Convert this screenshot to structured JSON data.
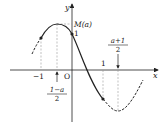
{
  "diagram": {
    "type": "function-graph",
    "axes": {
      "x_label": "x",
      "y_label": "y",
      "origin_label": "O"
    },
    "labels": {
      "max_value": "M(a)",
      "y_intercept": "1",
      "x_neg_one": "−1",
      "x_one": "1",
      "left_critical_num": "1−a",
      "left_critical_den": "2",
      "right_critical_num": "a+1",
      "right_critical_den": "2"
    },
    "points": [
      {
        "name": "point-x-neg-one",
        "x": -1
      },
      {
        "name": "y-intercept",
        "x": 0,
        "y": 1
      },
      {
        "name": "point-x-one",
        "x": 1
      }
    ],
    "colors": {
      "curve": "#222222",
      "guide": "#999999"
    }
  }
}
